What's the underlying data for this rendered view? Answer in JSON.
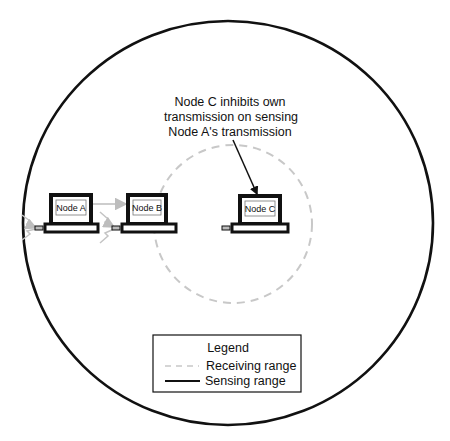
{
  "diagram": {
    "title": "",
    "colors": {
      "sensing_range": "#111111",
      "receiving_range": "#c8c8c8",
      "transmission_arrow": "#bdbdbd",
      "node_outline": "#111111"
    },
    "annotation": {
      "lines": [
        "Node C inhibits own",
        "transmission on sensing",
        "Node A's transmission"
      ],
      "points_to": "Node C"
    },
    "nodes": [
      {
        "id": "A",
        "label": "Node A"
      },
      {
        "id": "B",
        "label": "Node B"
      },
      {
        "id": "C",
        "label": "Node C"
      }
    ],
    "edges": [
      {
        "from": "Node A",
        "to": "Node B",
        "style": "gray-arrow"
      }
    ],
    "regions": [
      {
        "name": "Sensing range",
        "style": "solid",
        "around": "Node A"
      },
      {
        "name": "Receiving range",
        "style": "dashed",
        "around": "Node C"
      }
    ],
    "legend": {
      "title": "Legend",
      "items": [
        {
          "label": "Receiving range",
          "style": "dashed"
        },
        {
          "label": "Sensing range",
          "style": "solid"
        }
      ]
    }
  }
}
